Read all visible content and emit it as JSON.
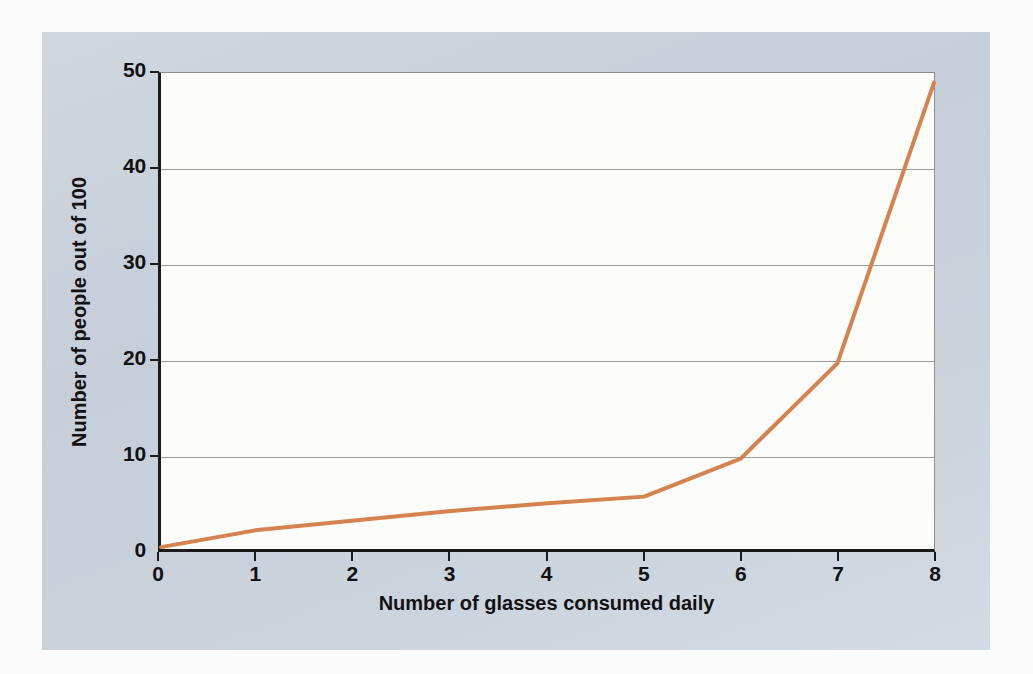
{
  "figure": {
    "panel_background_color": "#C5CED9",
    "page_background_color": "#FBFBFC",
    "plot_background_color": "#FCFCFA",
    "axis_color": "#1B1B1B",
    "gridline_color": "#9B9B9B"
  },
  "chart_data": {
    "type": "line",
    "title": "",
    "subtitle": "",
    "xlabel": "Number of glasses consumed daily",
    "ylabel": "Number of people out of 100",
    "xlim": [
      0,
      8
    ],
    "ylim": [
      0,
      50
    ],
    "xticks": [
      "0",
      "1",
      "2",
      "3",
      "4",
      "5",
      "6",
      "7",
      "8"
    ],
    "yticks": [
      "0",
      "10",
      "20",
      "30",
      "40",
      "50"
    ],
    "grid": "horizontal",
    "legend": "none",
    "series": [
      {
        "name": "People out of 100",
        "color": "#D5824E",
        "line_width": 4,
        "x": [
          0,
          1,
          2,
          3,
          4,
          5,
          6,
          7,
          8
        ],
        "values": [
          0.2,
          2.0,
          3.0,
          4.0,
          4.8,
          5.5,
          9.5,
          19.5,
          49.0
        ]
      }
    ]
  }
}
